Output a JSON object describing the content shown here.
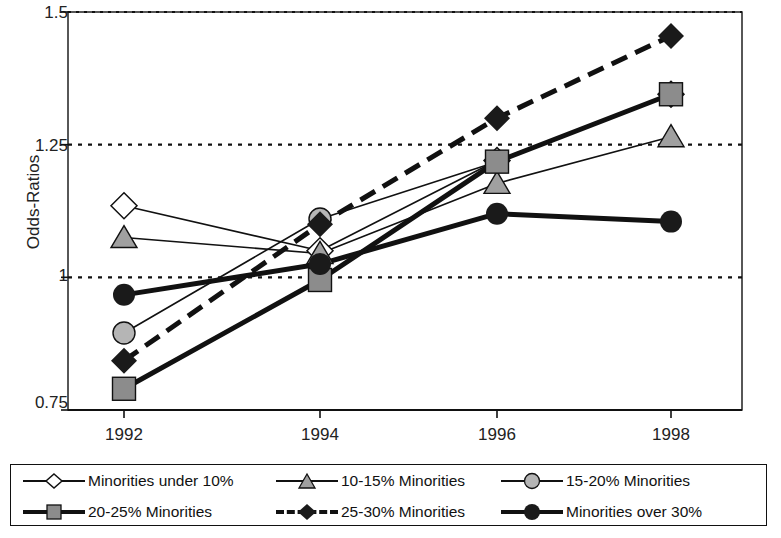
{
  "chart_data": {
    "type": "line",
    "title": "",
    "xlabel": "",
    "ylabel": "Odds-Ratios",
    "categories": [
      "1992",
      "1994",
      "1996",
      "1998"
    ],
    "x_tick_labels": [
      "1992",
      "1994",
      "1996",
      "1998"
    ],
    "y_tick_labels": [
      "1.5",
      "1.25",
      "1",
      "0.75"
    ],
    "y_tick_values": [
      1.5,
      1.25,
      1.0,
      0.75
    ],
    "ylim": [
      0.75,
      1.5
    ],
    "grid": "horizontal-dotted",
    "legend_position": "bottom",
    "series": [
      {
        "name": "Minorities under 10%",
        "marker": "diamond-open",
        "marker_fill": "#ffffff",
        "line_style": "solid",
        "line_weight": "thin",
        "values": [
          1.135,
          1.05,
          1.22,
          1.345
        ]
      },
      {
        "name": "10-15% Minorities",
        "marker": "triangle-gray",
        "marker_fill": "#a0a0a0",
        "line_style": "solid",
        "line_weight": "thin",
        "values": [
          1.075,
          1.045,
          1.177,
          1.265
        ]
      },
      {
        "name": "15-20% Minorities",
        "marker": "circle-gray",
        "marker_fill": "#b5b5b5",
        "line_style": "solid",
        "line_weight": "thin",
        "values": [
          0.895,
          1.11,
          1.218,
          1.345
        ]
      },
      {
        "name": "20-25% Minorities",
        "marker": "square-gray",
        "marker_fill": "#8c8c8c",
        "line_style": "solid",
        "line_weight": "thick",
        "values": [
          0.79,
          0.995,
          1.218,
          1.345
        ]
      },
      {
        "name": "25-30% Minorities",
        "marker": "diamond-black",
        "marker_fill": "#1a1a1a",
        "line_style": "dashed",
        "line_weight": "thick",
        "values": [
          0.843,
          1.1,
          1.3,
          1.455
        ]
      },
      {
        "name": "Minorities over 30%",
        "marker": "circle-black",
        "marker_fill": "#1a1a1a",
        "line_style": "solid",
        "line_weight": "thick",
        "values": [
          0.967,
          1.025,
          1.12,
          1.105
        ]
      }
    ]
  },
  "axis": {
    "y_label": "Odds-Ratios",
    "y_ticks": [
      "1.5",
      "1.25",
      "1",
      "0.75"
    ],
    "x_ticks": [
      "1992",
      "1994",
      "1996",
      "1998"
    ]
  },
  "legend": {
    "entries": [
      {
        "label": "Minorities under 10%"
      },
      {
        "label": "10-15% Minorities"
      },
      {
        "label": "15-20% Minorities"
      },
      {
        "label": "20-25% Minorities"
      },
      {
        "label": "25-30% Minorities"
      },
      {
        "label": "Minorities over 30%"
      }
    ]
  },
  "colors": {
    "ink": "#1a1a1a",
    "gray_light": "#b5b5b5",
    "gray_mid": "#a0a0a0",
    "gray_dark": "#8c8c8c",
    "white": "#ffffff"
  }
}
